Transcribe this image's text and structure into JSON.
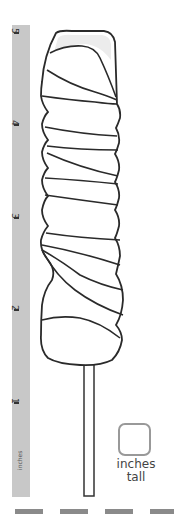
{
  "worksheet": {
    "ruler": {
      "unit_label": "inches",
      "ticks": [
        {
          "label": "5",
          "y": 33
        },
        {
          "label": "4",
          "y": 125
        },
        {
          "label": "3",
          "y": 218
        },
        {
          "label": "2",
          "y": 310
        },
        {
          "label": "1",
          "y": 403
        }
      ],
      "color": "#c8c8c8"
    },
    "object": "twisted lollipop",
    "answer": {
      "value": "",
      "caption_line1": "inches",
      "caption_line2": "tall"
    },
    "footer_dashes": 4
  }
}
